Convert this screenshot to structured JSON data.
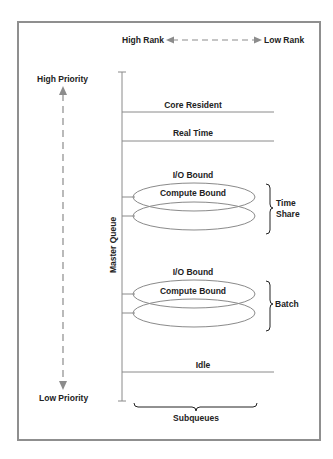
{
  "diagram": {
    "rank_axis": {
      "high_label": "High Rank",
      "low_label": "Low Rank"
    },
    "priority_axis": {
      "high_label": "High Priority",
      "low_label": "Low Priority"
    },
    "master_queue_label": "Master Queue",
    "subqueues": [
      {
        "label": "Core Resident",
        "kind": "line"
      },
      {
        "label": "Real Time",
        "kind": "line"
      },
      {
        "group": "Time Share",
        "group_line1": "Time",
        "group_line2": "Share",
        "top_label": "I/O Bound",
        "inner_label": "Compute Bound",
        "kind": "ellipses"
      },
      {
        "group": "Batch",
        "top_label": "I/O Bound",
        "inner_label": "Compute Bound",
        "kind": "ellipses"
      },
      {
        "label": "Idle",
        "kind": "line"
      }
    ],
    "subqueues_label": "Subqueues",
    "colors": {
      "line": "#8a8a8a",
      "arrow": "#8c8c8c",
      "text": "#222222",
      "frame": "#8f8f8f"
    }
  }
}
